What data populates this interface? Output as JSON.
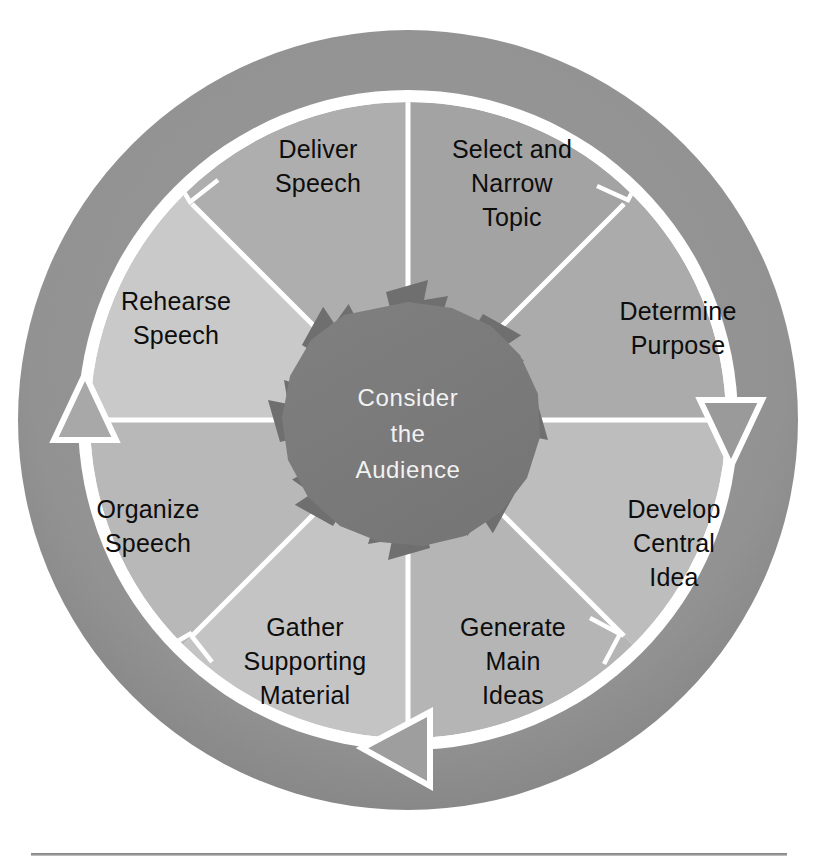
{
  "figure": {
    "shape": "circular cycle diagram",
    "hub": {
      "lines": [
        "Consider",
        "the",
        "Audience"
      ],
      "text": "Consider the Audience",
      "color": "#7a7a7a",
      "text_color": "#f2f2f2"
    },
    "outer_ring": {
      "color": "#909090",
      "inner_gap_color": "#ffffff"
    },
    "segment_count": 8,
    "flow_direction": "clockwise",
    "segments": [
      {
        "index": 0,
        "id": "select-and-narrow-topic",
        "lines": [
          "Select and",
          "Narrow",
          "Topic"
        ],
        "text": "Select and Narrow Topic",
        "color": "#a3a3a3",
        "start_angle": -90,
        "end_angle": -45
      },
      {
        "index": 1,
        "id": "determine-purpose",
        "lines": [
          "Determine",
          "Purpose"
        ],
        "text": "Determine Purpose",
        "color": "#ababab",
        "start_angle": -45,
        "end_angle": 0
      },
      {
        "index": 2,
        "id": "develop-central-idea",
        "lines": [
          "Develop",
          "Central",
          "Idea"
        ],
        "text": "Develop Central Idea",
        "color": "#bdbdbd",
        "start_angle": 0,
        "end_angle": 45
      },
      {
        "index": 3,
        "id": "generate-main-ideas",
        "lines": [
          "Generate",
          "Main",
          "Ideas"
        ],
        "text": "Generate Main Ideas",
        "color": "#b5b5b5",
        "start_angle": 45,
        "end_angle": 90
      },
      {
        "index": 4,
        "id": "gather-supporting-material",
        "lines": [
          "Gather",
          "Supporting",
          "Material"
        ],
        "text": "Gather Supporting Material",
        "color": "#c4c4c4",
        "start_angle": 90,
        "end_angle": 135
      },
      {
        "index": 5,
        "id": "organize-speech",
        "lines": [
          "Organize",
          "Speech"
        ],
        "text": "Organize Speech",
        "color": "#b8b8b8",
        "start_angle": 135,
        "end_angle": 180
      },
      {
        "index": 6,
        "id": "rehearse-speech",
        "lines": [
          "Rehearse",
          "Speech"
        ],
        "text": "Rehearse Speech",
        "color": "#c9c9c9",
        "start_angle": 180,
        "end_angle": 225
      },
      {
        "index": 7,
        "id": "deliver-speech",
        "lines": [
          "Deliver",
          "Speech"
        ],
        "text": "Deliver Speech",
        "color": "#aeaeae",
        "start_angle": 225,
        "end_angle": 270
      }
    ]
  },
  "footer": {
    "rule_color": "#8a8a8a"
  }
}
